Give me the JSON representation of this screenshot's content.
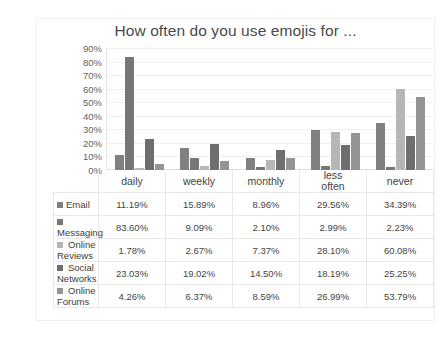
{
  "chart_data": {
    "type": "bar",
    "title": "How often do you use emojis for ...",
    "xlabel": "",
    "ylabel": "",
    "ylim": [
      0,
      90
    ],
    "ytick_labels": [
      "90%",
      "80%",
      "70%",
      "60%",
      "50%",
      "40%",
      "30%",
      "20%",
      "10%",
      "0%"
    ],
    "ytick_values": [
      90,
      80,
      70,
      60,
      50,
      40,
      30,
      20,
      10,
      0
    ],
    "grid": true,
    "legend_position": "table-below",
    "categories": [
      "daily",
      "weekly",
      "monthly",
      "less often",
      "never"
    ],
    "series": [
      {
        "name": "Email",
        "color": "#808080",
        "values": [
          11.19,
          15.89,
          8.96,
          29.56,
          34.39
        ],
        "labels": [
          "11.19%",
          "15.89%",
          "8.96%",
          "29.56%",
          "34.39%"
        ]
      },
      {
        "name": "Messaging",
        "color": "#767676",
        "values": [
          83.6,
          9.09,
          2.1,
          2.99,
          2.23
        ],
        "labels": [
          "83.60%",
          "9.09%",
          "2.10%",
          "2.99%",
          "2.23%"
        ]
      },
      {
        "name": "Online Reviews",
        "color": "#b6b6b6",
        "values": [
          1.78,
          2.67,
          7.37,
          28.1,
          60.08
        ],
        "labels": [
          "1.78%",
          "2.67%",
          "7.37%",
          "28.10%",
          "60.08%"
        ]
      },
      {
        "name": "Social Networks",
        "color": "#6e6e6e",
        "values": [
          23.03,
          19.02,
          14.5,
          18.19,
          25.25
        ],
        "labels": [
          "23.03%",
          "19.02%",
          "14.50%",
          "18.19%",
          "25.25%"
        ]
      },
      {
        "name": "Online Forums",
        "color": "#949494",
        "values": [
          4.26,
          6.37,
          8.59,
          26.99,
          53.79
        ],
        "labels": [
          "4.26%",
          "6.37%",
          "8.59%",
          "26.99%",
          "53.79%"
        ]
      }
    ]
  }
}
